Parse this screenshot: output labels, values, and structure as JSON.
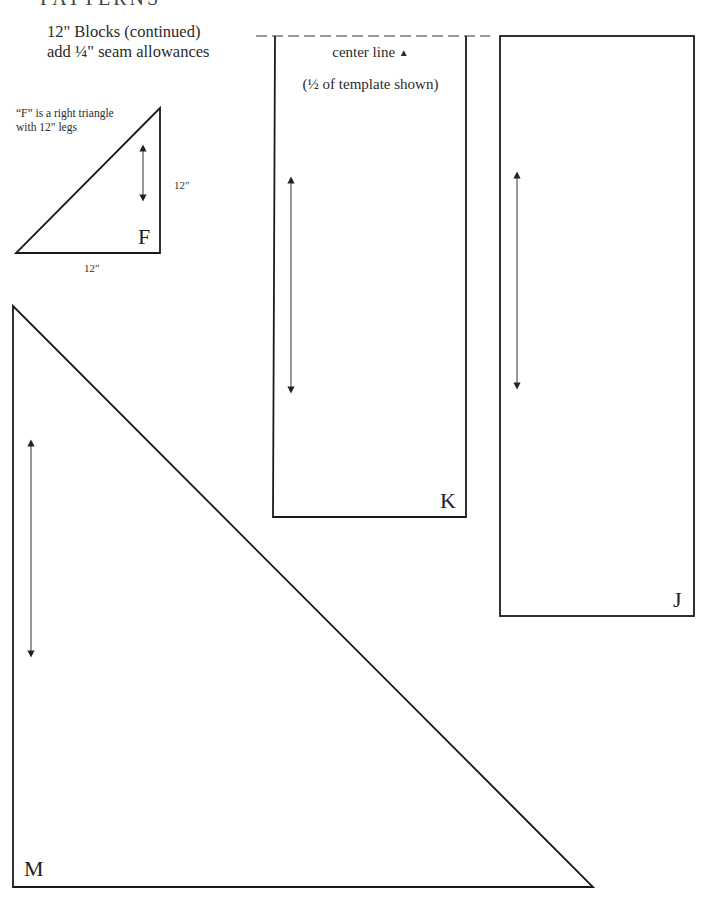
{
  "header": {
    "clipped_title": "PATTERNS",
    "line1": "12\" Blocks (continued)",
    "line2": "add ¼\" seam allowances"
  },
  "templates": {
    "F": {
      "label": "F",
      "note_line1": "“F” is a right triangle",
      "note_line2": "with 12\" legs",
      "leg_vertical": "12\"",
      "leg_horizontal": "12\""
    },
    "K": {
      "label": "K",
      "center_line_text": "center line",
      "center_marker": "▲",
      "half_note": "(½ of template shown)"
    },
    "J": {
      "label": "J"
    },
    "M": {
      "label": "M"
    }
  },
  "colors": {
    "line": "#1a1a1a",
    "arrow": "#555555",
    "dash": "#777777"
  }
}
